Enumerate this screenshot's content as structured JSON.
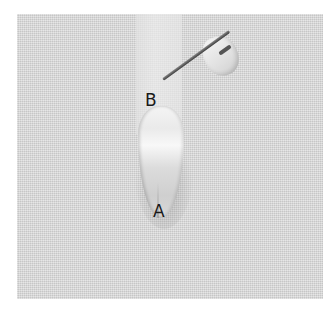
{
  "image": {
    "description": "Ribbon embroidery on linen fabric showing a petal stitch with needle",
    "labels": {
      "point_a": "A",
      "point_b": "B"
    },
    "colors": {
      "fabric": "#dcdcdc",
      "ribbon": "#f0f0f0",
      "needle": "#4a4a4a",
      "label_text": "#1a1a1a"
    }
  }
}
